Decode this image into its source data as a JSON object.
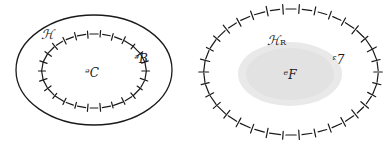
{
  "figure": {
    "width": 387,
    "height": 145,
    "background_color": "#ffffff",
    "ink_color": "#1a1a1a",
    "shade_color": "#e8e8e8",
    "panels": [
      {
        "id": "left-panel",
        "name": "nested-region-diagram",
        "outer_boundary": {
          "name": "solid-ellipse-P",
          "style": "solid",
          "cx": 94,
          "cy": 70,
          "rx": 78,
          "ry": 55,
          "stroke_width": 1.3
        },
        "inner_boundary": {
          "name": "hatched-ellipse-H",
          "style": "dashed-with-cross-ticks",
          "cx": 94,
          "cy": 71,
          "rx": 52,
          "ry": 37,
          "dash_count": 26,
          "stroke_width": 1.2
        },
        "labels": [
          {
            "id": "label-H",
            "text": "ℋ",
            "x": 47,
            "y": 35,
            "size": "normal"
          },
          {
            "id": "label-P",
            "text": "ᵊB",
            "x": 141,
            "y": 59,
            "size": "small"
          },
          {
            "id": "label-Q",
            "text": "ᵊC",
            "x": 92,
            "y": 73,
            "size": "small"
          }
        ]
      },
      {
        "id": "right-panel",
        "name": "shaded-region-diagram",
        "outer_boundary": {
          "name": "hatched-ellipse-H-R",
          "style": "dashed-with-cross-ticks",
          "cx": 291,
          "cy": 72,
          "rx": 87,
          "ry": 63,
          "dash_count": 34,
          "stroke_width": 1.2
        },
        "shaded_blob": {
          "name": "shaded-domain-D",
          "cx": 290,
          "cy": 74,
          "rx": 52,
          "ry": 32,
          "fill": "#e9e9e9"
        },
        "labels": [
          {
            "id": "label-H-R-base",
            "text": "ℋ",
            "x": 273,
            "y": 41,
            "size": "normal"
          },
          {
            "id": "label-H-R-sub",
            "text": "R",
            "x": 282,
            "y": 46,
            "size": "sub"
          },
          {
            "id": "label-B",
            "text": "ᵋ7",
            "x": 338,
            "y": 60,
            "size": "small"
          },
          {
            "id": "label-D",
            "text": "ᵉF",
            "x": 290,
            "y": 75,
            "size": "small"
          }
        ]
      }
    ]
  },
  "legend_text": {
    "script_H": "ℋ",
    "script_P": "ᵊB",
    "script_Q": "ᵊC",
    "script_B": "ᵋ7",
    "script_D": "ᵉF",
    "subscript_R": "R"
  }
}
